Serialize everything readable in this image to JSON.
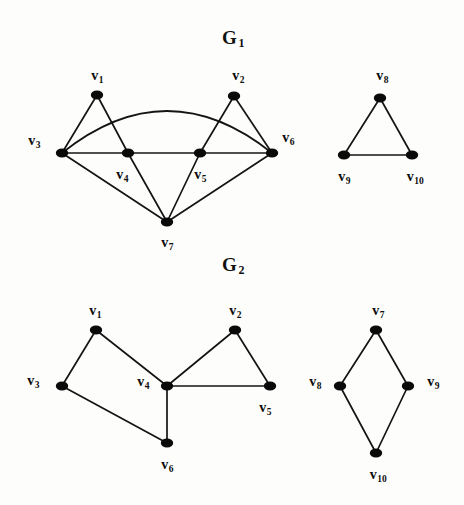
{
  "figure": {
    "background_color": "#fdfdfb",
    "ink_color": "#0d0d0d",
    "width": 464,
    "height": 505
  },
  "graphs": [
    {
      "id": "G1",
      "title_main": "G",
      "title_sub": "1",
      "title_x": 233,
      "title_y": 38,
      "components": [
        {
          "id": "g1-left",
          "vertices": [
            {
              "id": "v1",
              "main": "v",
              "sub": "1",
              "x": 97,
              "y": 95,
              "label_x": 97,
              "label_y": 76
            },
            {
              "id": "v2",
              "main": "v",
              "sub": "2",
              "x": 234,
              "y": 96,
              "label_x": 238,
              "label_y": 76
            },
            {
              "id": "v3",
              "main": "v",
              "sub": "3",
              "x": 62,
              "y": 153,
              "label_x": 34,
              "label_y": 141
            },
            {
              "id": "v4",
              "main": "v",
              "sub": "4",
              "x": 128,
              "y": 153,
              "label_x": 122,
              "label_y": 175
            },
            {
              "id": "v5",
              "main": "v",
              "sub": "5",
              "x": 200,
              "y": 153,
              "label_x": 200,
              "label_y": 175
            },
            {
              "id": "v6",
              "main": "v",
              "sub": "6",
              "x": 272,
              "y": 153,
              "label_x": 288,
              "label_y": 138
            },
            {
              "id": "v7",
              "main": "v",
              "sub": "7",
              "x": 167,
              "y": 222,
              "label_x": 167,
              "label_y": 243
            }
          ],
          "edges": [
            {
              "from": "v1",
              "to": "v3",
              "type": "line"
            },
            {
              "from": "v1",
              "to": "v4",
              "type": "line"
            },
            {
              "from": "v3",
              "to": "v4",
              "type": "line"
            },
            {
              "from": "v4",
              "to": "v5",
              "type": "line"
            },
            {
              "from": "v5",
              "to": "v6",
              "type": "line"
            },
            {
              "from": "v2",
              "to": "v5",
              "type": "line"
            },
            {
              "from": "v2",
              "to": "v6",
              "type": "line"
            },
            {
              "from": "v3",
              "to": "v7",
              "type": "line"
            },
            {
              "from": "v4",
              "to": "v7",
              "type": "line"
            },
            {
              "from": "v5",
              "to": "v7",
              "type": "line"
            },
            {
              "from": "v6",
              "to": "v7",
              "type": "line"
            },
            {
              "from": "v3",
              "to": "v6",
              "type": "arc",
              "bow": 42
            }
          ]
        },
        {
          "id": "g1-right",
          "vertices": [
            {
              "id": "v8",
              "main": "v",
              "sub": "8",
              "x": 380,
              "y": 98,
              "label_x": 382,
              "label_y": 76
            },
            {
              "id": "v9",
              "main": "v",
              "sub": "9",
              "x": 344,
              "y": 155,
              "label_x": 344,
              "label_y": 177
            },
            {
              "id": "v10",
              "main": "v",
              "sub": "10",
              "x": 412,
              "y": 155,
              "label_x": 415,
              "label_y": 177
            }
          ],
          "edges": [
            {
              "from": "v8",
              "to": "v9",
              "type": "line"
            },
            {
              "from": "v8",
              "to": "v10",
              "type": "line"
            },
            {
              "from": "v9",
              "to": "v10",
              "type": "line"
            }
          ]
        }
      ]
    },
    {
      "id": "G2",
      "title_main": "G",
      "title_sub": "2",
      "title_x": 233,
      "title_y": 265,
      "components": [
        {
          "id": "g2-left",
          "vertices": [
            {
              "id": "v1",
              "main": "v",
              "sub": "1",
              "x": 96,
              "y": 330,
              "label_x": 95,
              "label_y": 311
            },
            {
              "id": "v2",
              "main": "v",
              "sub": "2",
              "x": 235,
              "y": 330,
              "label_x": 235,
              "label_y": 311
            },
            {
              "id": "v3",
              "main": "v",
              "sub": "3",
              "x": 62,
              "y": 386,
              "label_x": 33,
              "label_y": 381
            },
            {
              "id": "v4",
              "main": "v",
              "sub": "4",
              "x": 167,
              "y": 386,
              "label_x": 143,
              "label_y": 382
            },
            {
              "id": "v5",
              "main": "v",
              "sub": "5",
              "x": 270,
              "y": 386,
              "label_x": 265,
              "label_y": 408
            },
            {
              "id": "v6",
              "main": "v",
              "sub": "6",
              "x": 167,
              "y": 443,
              "label_x": 167,
              "label_y": 465
            }
          ],
          "edges": [
            {
              "from": "v1",
              "to": "v3",
              "type": "line"
            },
            {
              "from": "v1",
              "to": "v4",
              "type": "line"
            },
            {
              "from": "v3",
              "to": "v6",
              "type": "line"
            },
            {
              "from": "v4",
              "to": "v6",
              "type": "line"
            },
            {
              "from": "v2",
              "to": "v4",
              "type": "line"
            },
            {
              "from": "v2",
              "to": "v5",
              "type": "line"
            },
            {
              "from": "v4",
              "to": "v5",
              "type": "line"
            }
          ]
        },
        {
          "id": "g2-right",
          "vertices": [
            {
              "id": "v7",
              "main": "v",
              "sub": "7",
              "x": 376,
              "y": 330,
              "label_x": 378,
              "label_y": 311
            },
            {
              "id": "v8",
              "main": "v",
              "sub": "8",
              "x": 340,
              "y": 386,
              "label_x": 315,
              "label_y": 382
            },
            {
              "id": "v9",
              "main": "v",
              "sub": "9",
              "x": 408,
              "y": 386,
              "label_x": 433,
              "label_y": 382
            },
            {
              "id": "v10",
              "main": "v",
              "sub": "10",
              "x": 376,
              "y": 453,
              "label_x": 378,
              "label_y": 475
            }
          ],
          "edges": [
            {
              "from": "v7",
              "to": "v8",
              "type": "line"
            },
            {
              "from": "v7",
              "to": "v9",
              "type": "line"
            },
            {
              "from": "v8",
              "to": "v10",
              "type": "line"
            },
            {
              "from": "v9",
              "to": "v10",
              "type": "line"
            }
          ]
        }
      ]
    }
  ]
}
